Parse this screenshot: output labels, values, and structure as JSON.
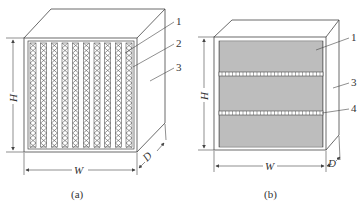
{
  "figure": {
    "panels": [
      {
        "id": "a",
        "caption": "(a)",
        "callouts": [
          "1",
          "2",
          "3"
        ],
        "dimensions": {
          "height": "H",
          "width": "W",
          "depth": "D"
        },
        "column_count": 10
      },
      {
        "id": "b",
        "caption": "(b)",
        "callouts": [
          "1",
          "3",
          "4"
        ],
        "dimensions": {
          "height": "H",
          "width": "W",
          "depth": "D"
        },
        "separator_count": 2
      }
    ]
  },
  "colors": {
    "line": "#444444",
    "fin": "#8a8a8a",
    "fill": "#ffffff"
  }
}
